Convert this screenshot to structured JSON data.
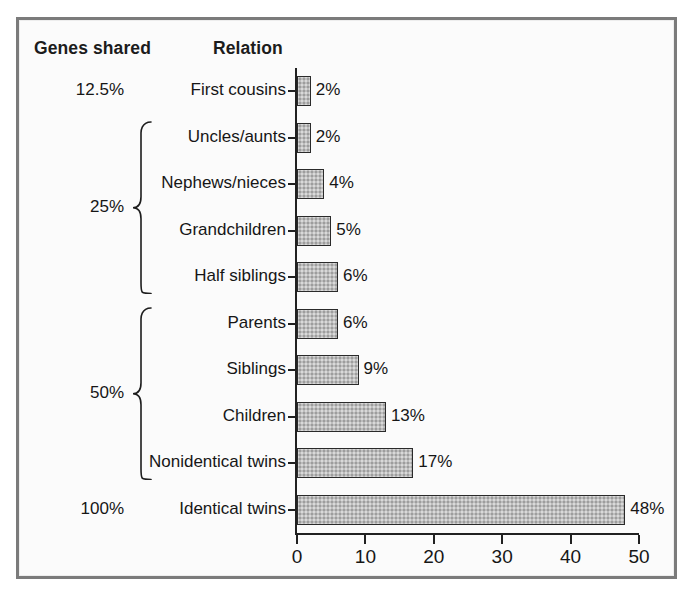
{
  "figure": {
    "background_color": "#fbfbfb",
    "frame_color": "#7b7b7b",
    "bar_fill_color": "#bdbdbd",
    "bar_edge_color": "#2a2a2a",
    "axis_color": "#212121",
    "text_color": "#161616"
  },
  "headers": {
    "genes_shared": "Genes shared",
    "relation": "Relation"
  },
  "groups": [
    {
      "label": "12.5%",
      "has_brace": false,
      "members": [
        "First cousins"
      ]
    },
    {
      "label": "25%",
      "has_brace": true,
      "members": [
        "Uncles/aunts",
        "Nephews/nieces",
        "Grandchildren",
        "Half siblings"
      ]
    },
    {
      "label": "50%",
      "has_brace": true,
      "members": [
        "Parents",
        "Siblings",
        "Children",
        "Nonidentical twins"
      ]
    },
    {
      "label": "100%",
      "has_brace": false,
      "members": [
        "Identical twins"
      ]
    }
  ],
  "chart_data": {
    "type": "bar",
    "orientation": "horizontal",
    "title": "",
    "subtitle": "",
    "xlabel": "",
    "ylabel": "",
    "xlim": [
      0,
      50
    ],
    "ylim": null,
    "grid": false,
    "legend": null,
    "xticks": [
      0,
      10,
      20,
      30,
      40,
      50
    ],
    "xticklabels": [
      "0",
      "10",
      "20",
      "30",
      "40",
      "50"
    ],
    "categories": [
      "First cousins",
      "Uncles/aunts",
      "Nephews/nieces",
      "Grandchildren",
      "Half siblings",
      "Parents",
      "Siblings",
      "Children",
      "Nonidentical twins",
      "Identical twins"
    ],
    "values": [
      2,
      2,
      4,
      5,
      6,
      6,
      9,
      13,
      17,
      48
    ],
    "data_labels": [
      "2%",
      "2%",
      "4%",
      "5%",
      "6%",
      "6%",
      "9%",
      "13%",
      "17%",
      "48%"
    ],
    "genes_shared": [
      "12.5%",
      "25%",
      "25%",
      "25%",
      "25%",
      "50%",
      "50%",
      "50%",
      "50%",
      "100%"
    ]
  }
}
